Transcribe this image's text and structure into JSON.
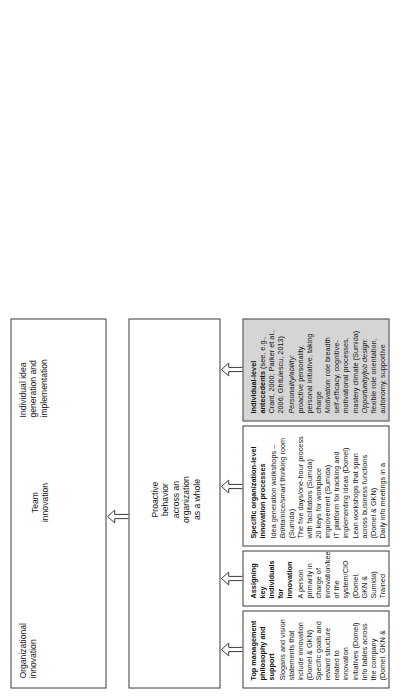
{
  "figure": {
    "type": "hierarchical-framework-diagram",
    "orientation": "rotated-90-ccw",
    "colors": {
      "box_border": "#3b3b3b",
      "box_fill": "#ffffff",
      "highlight_fill": "#d5d5d5",
      "text": "#161616"
    }
  },
  "outcomes": {
    "organizational": "Organizational\ninnovation",
    "team": "Team\ninnovation",
    "individual": "Individual idea\ngeneration and\nimplementation"
  },
  "mediator": {
    "label": "Proactive\nbehavior\nacross an\norganization\nas a whole"
  },
  "antecedents": [
    {
      "id": "top-management",
      "heading": "Top management philosophy and support",
      "shaded": false,
      "lines": [
        "Slogans and vision statements that include innovation (Domel & GKN)",
        "Specific goals and reward structure related to innovation initiatives (Domel)",
        "Info tables across the company (Domel, GKN &  Sumida)"
      ]
    },
    {
      "id": "key-individuals",
      "heading": "Assigning key individuals for innovation",
      "shaded": false,
      "lines": [
        "A person primarily in charge of innovation/keeper of the system/CIO (Domel, GKN & Sumida)",
        "Trained facilitators and/or evaluators (Domel, GKN & Sumida)"
      ]
    },
    {
      "id": "innovation-processes",
      "heading": "Specific organization-level innovation processes",
      "shaded": false,
      "lines": [
        "Idea generation workshops – <em>Brihta</em>/nice/smart thinking room (Sumida)",
        "The five days/one-hour process with facilitators (Sumida)",
        "20 keys for workplace improvement (Sumida)",
        "IT platform for tracking and implementing ideas (Domel)",
        "Lean workshops that span across business functions (Domel & GKN)",
        "Daily info meetings in a designated room, daily audits (GKN)",
        "Rather rigid formal process of idea evaluation and selection (Domel, GKN & Sumida)"
      ]
    },
    {
      "id": "individual-level",
      "heading": "Individual-level antecedents",
      "heading_note": " (see, e.g., Crant, 2000; Parker et al., 2006; Ghitulescu, 2013)",
      "shaded": true,
      "lines": [
        "<em>Personality/ability:</em> proactive personality, personal initiative, taking charge",
        "<em>Motivation:</em> role breadth self-efficacy, cognitive-motivational processes, mastery climate (Sumida)",
        "<em>Opportunity/job design:</em> flexible role orientation, autonomy, supportive supervision, coworker trust, task",
        "discretion, social ties, task interdependence, task complexity, coworkers' proactive behavior"
      ]
    }
  ],
  "arrows": {
    "count": 5,
    "style": "open-outline-arrow",
    "direction": "upward"
  }
}
